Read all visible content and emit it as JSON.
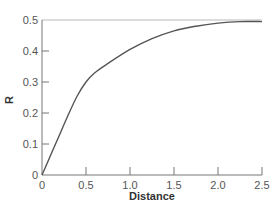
{
  "chart_data": {
    "type": "line",
    "title": "",
    "xlabel": "Distance",
    "ylabel": "R",
    "xlim": [
      0,
      2.5
    ],
    "ylim": [
      0,
      0.5
    ],
    "grid": false,
    "legend": null,
    "x_ticks": [
      "0",
      "0.5",
      "1.0",
      "1.5",
      "2.0",
      "2.5"
    ],
    "y_ticks": [
      "0",
      "0.1",
      "0.2",
      "0.3",
      "0.4",
      "0.5"
    ],
    "series": [
      {
        "name": "R",
        "x": [
          0,
          0.1,
          0.2,
          0.3,
          0.4,
          0.5,
          0.6,
          0.75,
          1.0,
          1.25,
          1.5,
          1.75,
          2.0,
          2.25,
          2.5
        ],
        "values": [
          0,
          0.065,
          0.13,
          0.195,
          0.255,
          0.3,
          0.33,
          0.36,
          0.405,
          0.44,
          0.465,
          0.48,
          0.49,
          0.495,
          0.495
        ]
      },
      {
        "name": "asymptote",
        "x": [
          0,
          2.5
        ],
        "values": [
          0.5,
          0.5
        ]
      }
    ]
  },
  "axes": {
    "x_title": "Distance",
    "y_title": "R"
  }
}
